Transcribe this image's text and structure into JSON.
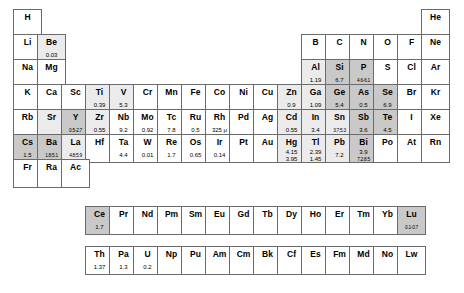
{
  "legend": {
    "shade_none": "#ffffff",
    "shade_light": "#ebebeb",
    "shade_mid": "#c9c9c9",
    "border": "#6b6b6b"
  },
  "layout": {
    "columns": 18,
    "main_rows": 7,
    "inner_rows": 2,
    "cell_width": 29,
    "cell_height": 29
  },
  "elements": [
    {
      "sym": "H",
      "col": 1,
      "row": 1,
      "shade": "none",
      "values": []
    },
    {
      "sym": "He",
      "col": 18,
      "row": 1,
      "shade": "none",
      "values": []
    },
    {
      "sym": "Li",
      "col": 1,
      "row": 2,
      "shade": "none",
      "values": []
    },
    {
      "sym": "Be",
      "col": 2,
      "row": 2,
      "shade": "light",
      "values": [
        "0.03"
      ]
    },
    {
      "sym": "B",
      "col": 13,
      "row": 2,
      "shade": "none",
      "values": []
    },
    {
      "sym": "C",
      "col": 14,
      "row": 2,
      "shade": "none",
      "values": []
    },
    {
      "sym": "N",
      "col": 15,
      "row": 2,
      "shade": "none",
      "values": []
    },
    {
      "sym": "O",
      "col": 16,
      "row": 2,
      "shade": "none",
      "values": []
    },
    {
      "sym": "F",
      "col": 17,
      "row": 2,
      "shade": "none",
      "values": []
    },
    {
      "sym": "Ne",
      "col": 18,
      "row": 2,
      "shade": "none",
      "values": []
    },
    {
      "sym": "Na",
      "col": 1,
      "row": 3,
      "shade": "none",
      "values": []
    },
    {
      "sym": "Mg",
      "col": 2,
      "row": 3,
      "shade": "none",
      "values": []
    },
    {
      "sym": "Al",
      "col": 13,
      "row": 3,
      "shade": "light",
      "values": [
        "1.19"
      ]
    },
    {
      "sym": "Si",
      "col": 14,
      "row": 3,
      "shade": "mid",
      "values": [
        "6.7"
      ]
    },
    {
      "sym": "P",
      "col": 15,
      "row": 3,
      "shade": "mid",
      "values": [
        "4.6-6.1"
      ]
    },
    {
      "sym": "S",
      "col": 16,
      "row": 3,
      "shade": "none",
      "values": []
    },
    {
      "sym": "Cl",
      "col": 17,
      "row": 3,
      "shade": "none",
      "values": []
    },
    {
      "sym": "Ar",
      "col": 18,
      "row": 3,
      "shade": "none",
      "values": []
    },
    {
      "sym": "K",
      "col": 1,
      "row": 4,
      "shade": "none",
      "values": []
    },
    {
      "sym": "Ca",
      "col": 2,
      "row": 4,
      "shade": "none",
      "values": []
    },
    {
      "sym": "Sc",
      "col": 3,
      "row": 4,
      "shade": "none",
      "values": []
    },
    {
      "sym": "Ti",
      "col": 4,
      "row": 4,
      "shade": "light",
      "values": [
        "0.39"
      ]
    },
    {
      "sym": "V",
      "col": 5,
      "row": 4,
      "shade": "light",
      "values": [
        "5.3"
      ]
    },
    {
      "sym": "Cr",
      "col": 6,
      "row": 4,
      "shade": "none",
      "values": []
    },
    {
      "sym": "Mn",
      "col": 7,
      "row": 4,
      "shade": "none",
      "values": []
    },
    {
      "sym": "Fe",
      "col": 8,
      "row": 4,
      "shade": "none",
      "values": []
    },
    {
      "sym": "Co",
      "col": 9,
      "row": 4,
      "shade": "none",
      "values": []
    },
    {
      "sym": "Ni",
      "col": 10,
      "row": 4,
      "shade": "none",
      "values": []
    },
    {
      "sym": "Cu",
      "col": 11,
      "row": 4,
      "shade": "none",
      "values": []
    },
    {
      "sym": "Zn",
      "col": 12,
      "row": 4,
      "shade": "light",
      "values": [
        "0.9"
      ]
    },
    {
      "sym": "Ga",
      "col": 13,
      "row": 4,
      "shade": "light",
      "values": [
        "1.09"
      ]
    },
    {
      "sym": "Ge",
      "col": 14,
      "row": 4,
      "shade": "mid",
      "values": [
        "5.4"
      ]
    },
    {
      "sym": "As",
      "col": 15,
      "row": 4,
      "shade": "mid",
      "values": [
        "0.5"
      ]
    },
    {
      "sym": "Se",
      "col": 16,
      "row": 4,
      "shade": "mid",
      "values": [
        "6.9"
      ]
    },
    {
      "sym": "Br",
      "col": 17,
      "row": 4,
      "shade": "none",
      "values": []
    },
    {
      "sym": "Kr",
      "col": 18,
      "row": 4,
      "shade": "none",
      "values": []
    },
    {
      "sym": "Rb",
      "col": 1,
      "row": 5,
      "shade": "none",
      "values": []
    },
    {
      "sym": "Sr",
      "col": 2,
      "row": 5,
      "shade": "light",
      "values": []
    },
    {
      "sym": "Y",
      "col": 3,
      "row": 5,
      "shade": "mid",
      "values": [
        "0.5-2.7"
      ]
    },
    {
      "sym": "Zr",
      "col": 4,
      "row": 5,
      "shade": "light",
      "values": [
        "0.55"
      ]
    },
    {
      "sym": "Nb",
      "col": 5,
      "row": 5,
      "shade": "none",
      "values": [
        "9.2"
      ]
    },
    {
      "sym": "Mo",
      "col": 6,
      "row": 5,
      "shade": "none",
      "values": [
        "0.92"
      ]
    },
    {
      "sym": "Tc",
      "col": 7,
      "row": 5,
      "shade": "none",
      "values": [
        "7.8"
      ]
    },
    {
      "sym": "Ru",
      "col": 8,
      "row": 5,
      "shade": "none",
      "values": [
        "0.5"
      ]
    },
    {
      "sym": "Rh",
      "col": 9,
      "row": 5,
      "shade": "none",
      "values": [
        "325 μ"
      ]
    },
    {
      "sym": "Pd",
      "col": 10,
      "row": 5,
      "shade": "none",
      "values": []
    },
    {
      "sym": "Ag",
      "col": 11,
      "row": 5,
      "shade": "none",
      "values": []
    },
    {
      "sym": "Cd",
      "col": 12,
      "row": 5,
      "shade": "light",
      "values": [
        "0.55"
      ]
    },
    {
      "sym": "In",
      "col": 13,
      "row": 5,
      "shade": "light",
      "values": [
        "3.4"
      ]
    },
    {
      "sym": "Sn",
      "col": 14,
      "row": 5,
      "shade": "light",
      "values": [
        "3.7;5.3"
      ]
    },
    {
      "sym": "Sb",
      "col": 15,
      "row": 5,
      "shade": "mid",
      "values": [
        "3.6"
      ]
    },
    {
      "sym": "Te",
      "col": 16,
      "row": 5,
      "shade": "mid",
      "values": [
        "4.5"
      ]
    },
    {
      "sym": "I",
      "col": 17,
      "row": 5,
      "shade": "none",
      "values": []
    },
    {
      "sym": "Xe",
      "col": 18,
      "row": 5,
      "shade": "none",
      "values": []
    },
    {
      "sym": "Cs",
      "col": 1,
      "row": 6,
      "shade": "mid",
      "values": [
        "1.5"
      ]
    },
    {
      "sym": "Ba",
      "col": 2,
      "row": 6,
      "shade": "mid",
      "values": [
        "1.8;5.1"
      ]
    },
    {
      "sym": "La",
      "col": 3,
      "row": 6,
      "shade": "light",
      "values": [
        "4.8;5.9"
      ]
    },
    {
      "sym": "Hf",
      "col": 4,
      "row": 6,
      "shade": "none",
      "values": []
    },
    {
      "sym": "Ta",
      "col": 5,
      "row": 6,
      "shade": "none",
      "values": [
        "4.4"
      ]
    },
    {
      "sym": "W",
      "col": 6,
      "row": 6,
      "shade": "none",
      "values": [
        "0.01"
      ]
    },
    {
      "sym": "Re",
      "col": 7,
      "row": 6,
      "shade": "none",
      "values": [
        "1.7"
      ]
    },
    {
      "sym": "Os",
      "col": 8,
      "row": 6,
      "shade": "none",
      "values": [
        "0.65"
      ]
    },
    {
      "sym": "Ir",
      "col": 9,
      "row": 6,
      "shade": "none",
      "values": [
        "0.14"
      ]
    },
    {
      "sym": "Pt",
      "col": 10,
      "row": 6,
      "shade": "none",
      "values": []
    },
    {
      "sym": "Au",
      "col": 11,
      "row": 6,
      "shade": "none",
      "values": []
    },
    {
      "sym": "Hg",
      "col": 12,
      "row": 6,
      "shade": "light",
      "values": [
        "4.15",
        "3.95"
      ]
    },
    {
      "sym": "Tl",
      "col": 13,
      "row": 6,
      "shade": "light",
      "values": [
        "2.39",
        "1.45"
      ]
    },
    {
      "sym": "Pb",
      "col": 14,
      "row": 6,
      "shade": "light",
      "values": [
        "7.2"
      ]
    },
    {
      "sym": "Bi",
      "col": 15,
      "row": 6,
      "shade": "mid",
      "values": [
        "3.9",
        "7.2;8.5"
      ]
    },
    {
      "sym": "Po",
      "col": 16,
      "row": 6,
      "shade": "none",
      "values": []
    },
    {
      "sym": "At",
      "col": 17,
      "row": 6,
      "shade": "none",
      "values": []
    },
    {
      "sym": "Rn",
      "col": 18,
      "row": 6,
      "shade": "none",
      "values": []
    },
    {
      "sym": "Fr",
      "col": 1,
      "row": 7,
      "shade": "none",
      "values": []
    },
    {
      "sym": "Ra",
      "col": 2,
      "row": 7,
      "shade": "none",
      "values": []
    },
    {
      "sym": "Ac",
      "col": 3,
      "row": 7,
      "shade": "none",
      "values": []
    }
  ],
  "lanthanides": [
    {
      "sym": "Ce",
      "col": 4,
      "shade": "mid",
      "values": [
        "1.7"
      ]
    },
    {
      "sym": "Pr",
      "col": 5,
      "shade": "none",
      "values": []
    },
    {
      "sym": "Nd",
      "col": 6,
      "shade": "none",
      "values": []
    },
    {
      "sym": "Pm",
      "col": 7,
      "shade": "none",
      "values": []
    },
    {
      "sym": "Sm",
      "col": 8,
      "shade": "none",
      "values": []
    },
    {
      "sym": "Eu",
      "col": 9,
      "shade": "none",
      "values": []
    },
    {
      "sym": "Gd",
      "col": 10,
      "shade": "none",
      "values": []
    },
    {
      "sym": "Tb",
      "col": 11,
      "shade": "none",
      "values": []
    },
    {
      "sym": "Dy",
      "col": 12,
      "shade": "none",
      "values": []
    },
    {
      "sym": "Ho",
      "col": 13,
      "shade": "none",
      "values": []
    },
    {
      "sym": "Er",
      "col": 14,
      "shade": "none",
      "values": []
    },
    {
      "sym": "Tm",
      "col": 15,
      "shade": "none",
      "values": []
    },
    {
      "sym": "Yb",
      "col": 16,
      "shade": "none",
      "values": []
    },
    {
      "sym": "Lu",
      "col": 17,
      "shade": "mid",
      "values": [
        "0.1-0.7"
      ]
    }
  ],
  "actinides": [
    {
      "sym": "Th",
      "col": 4,
      "shade": "none",
      "values": [
        "1.37"
      ]
    },
    {
      "sym": "Pa",
      "col": 5,
      "shade": "none",
      "values": [
        "1.3"
      ]
    },
    {
      "sym": "U",
      "col": 6,
      "shade": "none",
      "values": [
        "0.2"
      ]
    },
    {
      "sym": "Np",
      "col": 7,
      "shade": "none",
      "values": []
    },
    {
      "sym": "Pu",
      "col": 8,
      "shade": "none",
      "values": []
    },
    {
      "sym": "Am",
      "col": 9,
      "shade": "none",
      "values": []
    },
    {
      "sym": "Cm",
      "col": 10,
      "shade": "none",
      "values": []
    },
    {
      "sym": "Bk",
      "col": 11,
      "shade": "none",
      "values": []
    },
    {
      "sym": "Cf",
      "col": 12,
      "shade": "none",
      "values": []
    },
    {
      "sym": "Es",
      "col": 13,
      "shade": "none",
      "values": []
    },
    {
      "sym": "Fm",
      "col": 14,
      "shade": "none",
      "values": []
    },
    {
      "sym": "Md",
      "col": 15,
      "shade": "none",
      "values": []
    },
    {
      "sym": "No",
      "col": 16,
      "shade": "none",
      "values": []
    },
    {
      "sym": "Lw",
      "col": 17,
      "shade": "none",
      "values": []
    }
  ]
}
